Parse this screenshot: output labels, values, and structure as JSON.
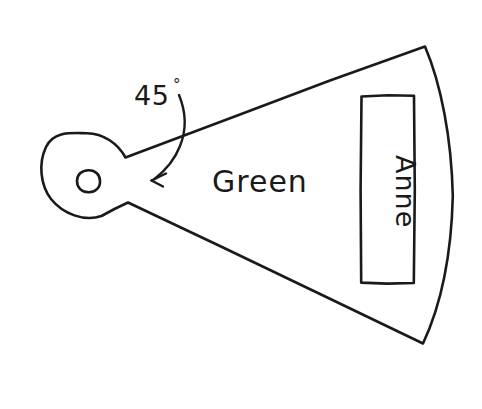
{
  "figure": {
    "background_color": "#ffffff",
    "ink_color": "#1a1a1a",
    "width": 482,
    "height": 409
  },
  "labels": {
    "angle_value": "45",
    "angle_degree_symbol": "°",
    "sector_label": "Green",
    "plate_label": "Anne"
  },
  "annotations": {
    "arrow_name": "curved-arrow-to-angle",
    "arrow_points_to": "apex-upper-edge",
    "anne_text_rotation_degrees": 90
  },
  "parts": {
    "hub_circle": "circular hub with center hole",
    "hub_hole": "small inner circle",
    "sector": "wedge widening to the right",
    "outer_edge": "convex arc on the right",
    "plate": "rectangle containing the Anne label"
  },
  "geometry": {
    "hub_center_x": 86,
    "hub_center_y": 179,
    "hub_radius": 44,
    "hole_center_x": 88,
    "hole_center_y": 181,
    "hole_radius": 11,
    "wedge_upper_start_x": 125,
    "wedge_upper_start_y": 158,
    "wedge_upper_end_x": 425,
    "wedge_upper_end_y": 46,
    "wedge_lower_start_x": 128,
    "wedge_lower_start_y": 202,
    "wedge_lower_end_x": 423,
    "wedge_lower_end_y": 343,
    "arc_extreme_x": 453,
    "arc_extreme_y": 196,
    "rect_left": 361,
    "rect_top": 95,
    "rect_right": 414,
    "rect_bottom": 283
  }
}
